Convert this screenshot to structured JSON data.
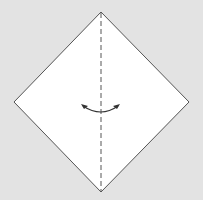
{
  "diagram": {
    "type": "origami-fold-step",
    "background_color": "#e3e3e3",
    "paper_color": "#ffffff",
    "edge_color": "#555555",
    "fold_line": {
      "style": "valley-fold-dashed",
      "orientation": "vertical"
    },
    "arrow": {
      "meaning": "fold-direction",
      "shape": "curved-double-ended"
    },
    "shape": "square-rotated-45"
  }
}
